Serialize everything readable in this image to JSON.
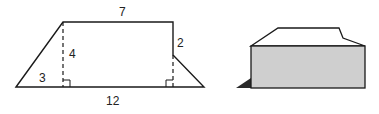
{
  "colors": {
    "stroke": "#1a1a1a",
    "fill_box": "#cfcfcf",
    "shadow": "#2a2a2a",
    "background": "#ffffff"
  },
  "trapezoid": {
    "labels": {
      "top": "7",
      "left_height": "4",
      "right_height": "2",
      "left_base_segment": "3",
      "bottom": "12"
    }
  },
  "solid": {
    "description": "3D box with sloped roof"
  }
}
